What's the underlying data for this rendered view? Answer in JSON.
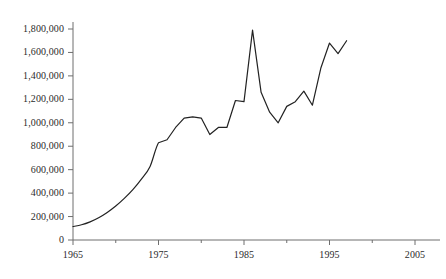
{
  "chart_data": {
    "type": "line",
    "title": "",
    "subtitle": "",
    "xlabel": "",
    "ylabel": "",
    "xlim": [
      1965,
      2007
    ],
    "ylim": [
      0,
      1800000
    ],
    "grid": false,
    "legend": "none",
    "x_ticks": [
      1965,
      1975,
      1985,
      1995,
      2005
    ],
    "x_tick_labels": [
      "1965",
      "1975",
      "1985",
      "1995",
      "2005"
    ],
    "x_minor_tick_interval": 5,
    "y_ticks": [
      0,
      200000,
      400000,
      600000,
      800000,
      1000000,
      1200000,
      1400000,
      1600000,
      1800000
    ],
    "y_tick_labels": [
      "0",
      "200,000",
      "400,000",
      "600,000",
      "800,000",
      "1,000,000",
      "1,200,000",
      "1,400,000",
      "1,600,000",
      "1,800,000"
    ],
    "line_color": "#222222",
    "line_width": 1.2,
    "series": [
      {
        "name": "series-1",
        "x": [
          1965,
          1966,
          1967,
          1968,
          1969,
          1970,
          1971,
          1972,
          1973,
          1974,
          1975,
          1976,
          1977,
          1978,
          1979,
          1980,
          1981,
          1982,
          1983,
          1984,
          1985,
          1986,
          1987,
          1988,
          1989,
          1990,
          1991,
          1992,
          1993,
          1994,
          1995,
          1996,
          1997
        ],
        "values": [
          115000,
          130000,
          155000,
          190000,
          235000,
          290000,
          355000,
          430000,
          520000,
          625000,
          830000,
          855000,
          960000,
          1040000,
          1050000,
          1040000,
          900000,
          960000,
          960000,
          1190000,
          1180000,
          1790000,
          1260000,
          1090000,
          1000000,
          1140000,
          1180000,
          1270000,
          1150000,
          1470000,
          1680000,
          1590000,
          1700000
        ]
      }
    ],
    "notes": {
      "peak_year": 1986,
      "peak_value": 1790000,
      "start_year": 1965,
      "start_value": 115000,
      "end_year": 1997,
      "end_value": 1700000,
      "trough_after_peak_year": 1989,
      "trough_after_peak_value": 1000000
    }
  },
  "axes": {
    "y_axis_name": "y-axis",
    "x_axis_name": "x-axis"
  }
}
